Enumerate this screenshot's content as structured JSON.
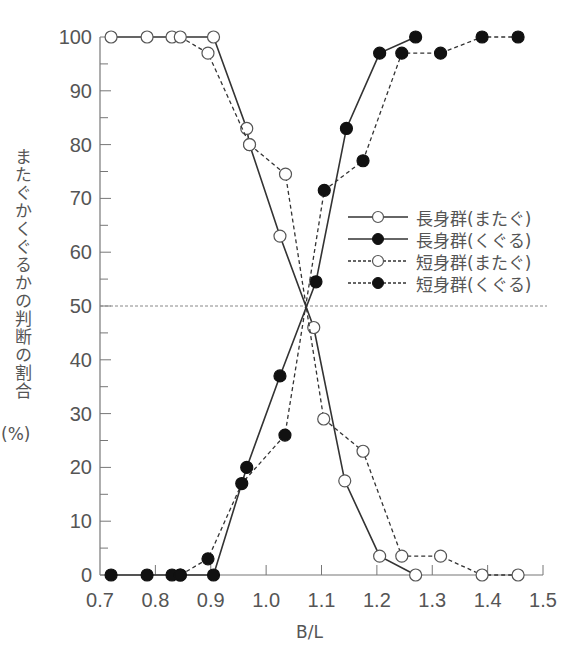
{
  "chart_data": {
    "type": "line",
    "title": "",
    "xlabel": "B/L",
    "ylabel": "またぐかくぐるかの判断の割合",
    "ylabel_unit": "(%)",
    "xlim": [
      0.7,
      1.5
    ],
    "ylim": [
      0,
      100
    ],
    "x_ticks": [
      "0.7",
      "0.8",
      "0.9",
      "1.0",
      "1.1",
      "1.2",
      "1.3",
      "1.4",
      "1.5"
    ],
    "y_ticks": [
      "0",
      "10",
      "20",
      "30",
      "40",
      "50",
      "60",
      "70",
      "80",
      "90",
      "100"
    ],
    "reference_line": {
      "y": 50,
      "style": "dashed"
    },
    "grid": false,
    "legend_position": "right-middle",
    "series": [
      {
        "name": "長身群(またぐ)",
        "line": "solid",
        "marker": "open-circle",
        "x": [
          0.72,
          0.785,
          0.83,
          0.905,
          0.965,
          0.97,
          1.025,
          1.086,
          1.142,
          1.205,
          1.27
        ],
        "y": [
          100,
          100,
          100,
          100,
          83,
          80,
          63,
          46,
          17.5,
          3.5,
          0
        ]
      },
      {
        "name": "長身群(くぐる)",
        "line": "solid",
        "marker": "filled-circle",
        "x": [
          0.72,
          0.785,
          0.83,
          0.845,
          0.905,
          0.965,
          1.025,
          1.09,
          1.145,
          1.205,
          1.27
        ],
        "y": [
          0,
          0,
          0,
          0,
          0,
          20,
          37,
          54.5,
          83,
          97,
          100
        ]
      },
      {
        "name": "短身群(またぐ)",
        "line": "dashed",
        "marker": "open-circle",
        "x": [
          0.845,
          0.895,
          0.97,
          1.035,
          1.104,
          1.175,
          1.245,
          1.315,
          1.39,
          1.455
        ],
        "y": [
          100,
          97,
          80,
          74.5,
          29,
          23,
          3.5,
          3.5,
          0,
          0
        ]
      },
      {
        "name": "短身群(くぐる)",
        "line": "dashed",
        "marker": "filled-circle",
        "x": [
          0.845,
          0.895,
          0.956,
          1.034,
          1.105,
          1.175,
          1.245,
          1.315,
          1.39,
          1.455
        ],
        "y": [
          0,
          3,
          17,
          26,
          71.5,
          77,
          97,
          97,
          100,
          100
        ]
      }
    ]
  },
  "legend": {
    "items": [
      {
        "label": "長身群(またぐ)",
        "line": "solid",
        "marker": "open"
      },
      {
        "label": "長身群(くぐる)",
        "line": "solid",
        "marker": "filled"
      },
      {
        "label": "短身群(またぐ)",
        "line": "dashed",
        "marker": "open"
      },
      {
        "label": "短身群(くぐる)",
        "line": "dashed",
        "marker": "filled"
      }
    ]
  },
  "colors": {
    "axis": "#777777",
    "line": "#333333",
    "text": "#555555",
    "marker_fill_open": "#ffffff",
    "marker_fill_filled": "#111111"
  }
}
